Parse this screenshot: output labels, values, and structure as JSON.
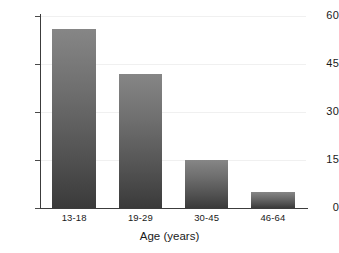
{
  "chart_data": {
    "type": "bar",
    "title": "",
    "subtitle": "",
    "xlabel": "Age (years)",
    "ylabel": "",
    "categories": [
      "13-18",
      "19-29",
      "30-45",
      "46-64"
    ],
    "values": [
      56,
      42,
      15,
      5
    ],
    "ylim": [
      0,
      60
    ],
    "y_ticks": [
      0,
      15,
      30,
      45,
      60
    ],
    "y_tick_labels": [
      "0",
      "15",
      "30",
      "45",
      "60"
    ],
    "grid": true,
    "legend": false,
    "legend_position": "none",
    "annotations": [],
    "colors": {
      "bar_top": "#868686",
      "bar_bottom": "#3a3a3a",
      "axis": "#3c3c3c",
      "gridline": "#f0f0f0",
      "text": "#1a1a1a",
      "background": "#ffffff"
    }
  }
}
